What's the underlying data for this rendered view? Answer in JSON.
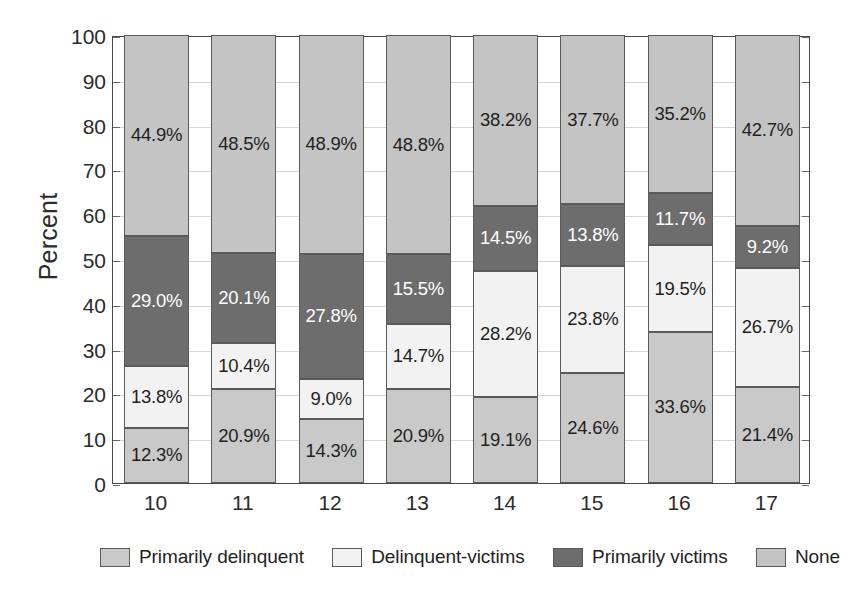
{
  "chart_data": {
    "type": "bar",
    "subtype": "stacked-100-percent",
    "title": "",
    "xlabel": "",
    "ylabel": "Percent",
    "ylim": [
      0,
      100
    ],
    "yticks": [
      0,
      10,
      20,
      30,
      40,
      50,
      60,
      70,
      80,
      90,
      100
    ],
    "ytick_labels": [
      "0",
      "10",
      "20",
      "30",
      "40",
      "50",
      "60",
      "70",
      "80",
      "90",
      "100"
    ],
    "grid": true,
    "legend_position": "bottom",
    "categories": [
      "10",
      "11",
      "12",
      "13",
      "14",
      "15",
      "16",
      "17"
    ],
    "series": [
      {
        "name": "Primarily delinquent",
        "color": "#c9c9c9",
        "text_color": "dark",
        "values": [
          12.3,
          20.9,
          14.3,
          20.9,
          19.1,
          24.6,
          33.6,
          21.4
        ],
        "labels": [
          "12.3%",
          "20.9%",
          "14.3%",
          "20.9%",
          "19.1%",
          "24.6%",
          "33.6%",
          "21.4%"
        ]
      },
      {
        "name": "Delinquent-victims",
        "color": "#f2f2f2",
        "text_color": "dark",
        "values": [
          13.8,
          10.4,
          9.0,
          14.7,
          28.2,
          23.8,
          19.5,
          26.7
        ],
        "labels": [
          "13.8%",
          "10.4%",
          "9.0%",
          "14.7%",
          "28.2%",
          "23.8%",
          "19.5%",
          "26.7%"
        ]
      },
      {
        "name": "Primarily victims",
        "color": "#6d6d6d",
        "text_color": "light",
        "values": [
          29.0,
          20.1,
          27.8,
          15.5,
          14.5,
          13.8,
          11.7,
          9.2
        ],
        "labels": [
          "29.0%",
          "20.1%",
          "27.8%",
          "15.5%",
          "14.5%",
          "13.8%",
          "11.7%",
          "9.2%"
        ]
      },
      {
        "name": "None",
        "color": "#c4c4c4",
        "text_color": "dark",
        "values": [
          44.9,
          48.5,
          48.9,
          48.8,
          38.2,
          37.7,
          35.2,
          42.7
        ],
        "labels": [
          "44.9%",
          "48.5%",
          "48.9%",
          "48.8%",
          "38.2%",
          "37.7%",
          "35.2%",
          "42.7%"
        ]
      }
    ]
  },
  "axis": {
    "y_title": "Percent"
  },
  "legend": {
    "items": [
      {
        "label": "Primarily delinquent",
        "color": "#c9c9c9"
      },
      {
        "label": "Delinquent-victims",
        "color": "#f2f2f2"
      },
      {
        "label": "Primarily victims",
        "color": "#6d6d6d"
      },
      {
        "label": "None",
        "color": "#c4c4c4"
      }
    ]
  }
}
